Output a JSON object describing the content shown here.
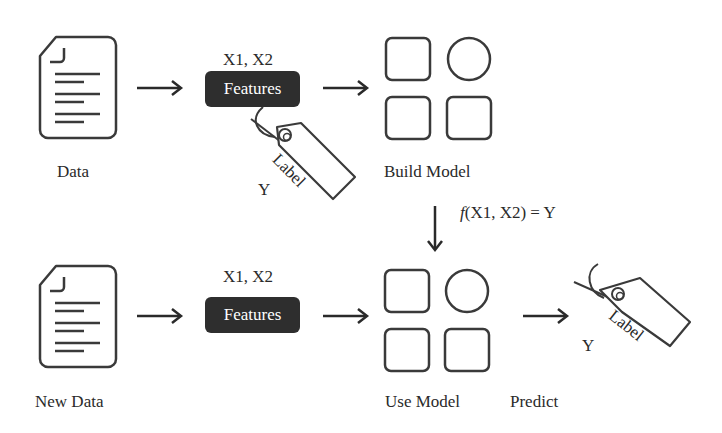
{
  "diagram": {
    "type": "machine-learning-workflow",
    "top_row": {
      "data_label": "Data",
      "features_header": "X1, X2",
      "features_label": "Features",
      "tag_text": "Label",
      "tag_y": "Y",
      "model_label": "Build Model"
    },
    "transition": {
      "formula_fn": "f",
      "formula_rest": "(X1, X2) = Y"
    },
    "bottom_row": {
      "data_label": "New Data",
      "features_header": "X1, X2",
      "features_label": "Features",
      "model_label": "Use Model",
      "predict_label": "Predict",
      "tag_text": "Label",
      "tag_y": "Y"
    },
    "icons": [
      "document-icon",
      "features-box",
      "label-tag-icon",
      "model-grid-icon",
      "arrow-right-icon",
      "arrow-down-icon"
    ],
    "colors": {
      "stroke": "#3a3a3a",
      "features_bg": "#2e2e2e",
      "features_text": "#ffffff",
      "background": "#ffffff"
    }
  }
}
